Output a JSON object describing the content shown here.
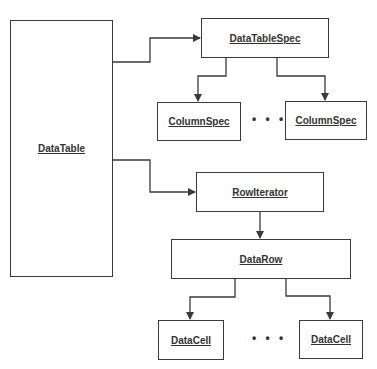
{
  "diagram": {
    "type": "class-hierarchy",
    "nodes": {
      "data_table": "DataTable",
      "data_table_spec": "DataTableSpec",
      "column_spec_first": "ColumnSpec",
      "column_spec_last": "ColumnSpec",
      "row_iterator": "RowIterator",
      "data_row": "DataRow",
      "data_cell_first": "DataCell",
      "data_cell_last": "DataCell"
    },
    "ellipsis": "• • •",
    "edges": [
      {
        "from": "DataTable",
        "to": "DataTableSpec"
      },
      {
        "from": "DataTable",
        "to": "RowIterator"
      },
      {
        "from": "DataTableSpec",
        "to": "ColumnSpec (first)"
      },
      {
        "from": "DataTableSpec",
        "to": "ColumnSpec (last)"
      },
      {
        "from": "RowIterator",
        "to": "DataRow"
      },
      {
        "from": "DataRow",
        "to": "DataCell (first)"
      },
      {
        "from": "DataRow",
        "to": "DataCell (last)"
      }
    ],
    "colors": {
      "stroke": "#3a3a3a",
      "text": "#333333",
      "background": "#ffffff"
    }
  }
}
